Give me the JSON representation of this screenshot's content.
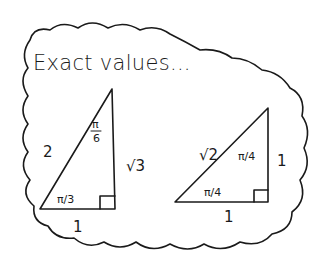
{
  "title": "Exact values...",
  "triangles": [
    {
      "name": "30-60-90",
      "sides": {
        "hypotenuse": "2",
        "base": "1",
        "vertical": "√3"
      },
      "angles": {
        "top": "π/6",
        "bottom_left": "π/3",
        "bottom_right": "right-angle"
      }
    },
    {
      "name": "45-45-90",
      "sides": {
        "hypotenuse": "√2",
        "base": "1",
        "vertical": "1"
      },
      "angles": {
        "top": "π/4",
        "bottom_left": "π/4",
        "bottom_right": "right-angle"
      }
    }
  ],
  "labels": {
    "t1_hyp": "2",
    "t1_base": "1",
    "t1_vert": "√3",
    "t1_top_num": "π",
    "t1_top_den": "6",
    "t1_bl": "π/3",
    "t2_hyp": "√2",
    "t2_base": "1",
    "t2_vert": "1",
    "t2_top": "π/4",
    "t2_bl": "π/4"
  },
  "colors": {
    "ink": "#1a1a1a",
    "paper": "#ffffff"
  }
}
